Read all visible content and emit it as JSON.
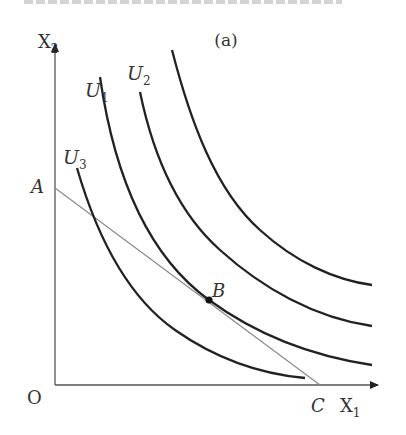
{
  "figure": {
    "panel_label": "(a)",
    "clipped_title_visible": true
  },
  "axes": {
    "x_label": "X",
    "x_label_sub": "1",
    "y_label": "X",
    "y_label_sub": "2",
    "origin_label": "O"
  },
  "points": {
    "A": "A",
    "B": "B",
    "C": "C"
  },
  "curves": [
    {
      "name": "U",
      "sub": "1"
    },
    {
      "name": "U",
      "sub": "2"
    },
    {
      "name": "U",
      "sub": "3"
    }
  ],
  "colors": {
    "curve": "#222222",
    "budget_line": "#8a8a8a",
    "axis": "#555555",
    "text": "#333333"
  }
}
